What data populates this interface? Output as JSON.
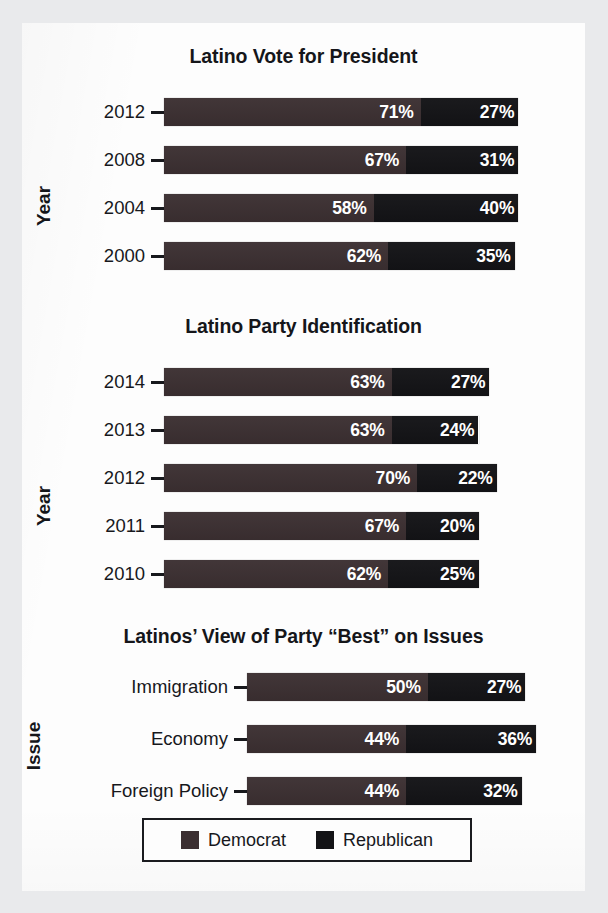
{
  "page": {
    "background_color": "#e9eaec",
    "sheet_color": "#fdfdfd"
  },
  "colors": {
    "democrat": "#3b2f31",
    "republican": "#131316",
    "text": "#17181c"
  },
  "legend": {
    "items": [
      {
        "label": "Democrat",
        "color": "#3b2f31",
        "swatch": "democrat-swatch"
      },
      {
        "label": "Republican",
        "color": "#131316",
        "swatch": "republican-swatch"
      }
    ]
  },
  "chart_data": [
    {
      "id": "latino-vote-for-president",
      "type": "bar",
      "orientation": "horizontal",
      "stacked": true,
      "title": "Latino Vote for President",
      "ylabel": "Year",
      "xlabel": "",
      "grid": false,
      "legend_position": "bottom",
      "xlim": [
        0,
        100
      ],
      "categories": [
        "2012",
        "2008",
        "2004",
        "2000"
      ],
      "series": [
        {
          "name": "Democrat",
          "values": [
            71,
            67,
            58,
            62
          ]
        },
        {
          "name": "Republican",
          "values": [
            27,
            31,
            40,
            35
          ]
        }
      ],
      "labels": {
        "Democrat": [
          "71%",
          "67%",
          "58%",
          "62%"
        ],
        "Republican": [
          "27%",
          "31%",
          "40%",
          "35%"
        ]
      }
    },
    {
      "id": "latino-party-identification",
      "type": "bar",
      "orientation": "horizontal",
      "stacked": true,
      "title": "Latino Party Identification",
      "ylabel": "Year",
      "xlabel": "",
      "grid": false,
      "legend_position": "bottom",
      "xlim": [
        0,
        100
      ],
      "categories": [
        "2014",
        "2013",
        "2012",
        "2011",
        "2010"
      ],
      "series": [
        {
          "name": "Democrat",
          "values": [
            63,
            63,
            70,
            67,
            62
          ]
        },
        {
          "name": "Republican",
          "values": [
            27,
            24,
            22,
            20,
            25
          ]
        }
      ],
      "labels": {
        "Democrat": [
          "63%",
          "63%",
          "70%",
          "67%",
          "62%"
        ],
        "Republican": [
          "27%",
          "24%",
          "22%",
          "20%",
          "25%"
        ]
      }
    },
    {
      "id": "latinos-view-of-party-best-on-issues",
      "type": "bar",
      "orientation": "horizontal",
      "stacked": true,
      "title": "Latinos’ View of Party “Best” on Issues",
      "ylabel": "Issue",
      "xlabel": "",
      "grid": false,
      "legend_position": "bottom",
      "xlim": [
        0,
        100
      ],
      "categories": [
        "Immigration",
        "Economy",
        "Foreign Policy"
      ],
      "series": [
        {
          "name": "Democrat",
          "values": [
            50,
            44,
            44
          ]
        },
        {
          "name": "Republican",
          "values": [
            27,
            36,
            32
          ]
        }
      ],
      "labels": {
        "Democrat": [
          "50%",
          "44%",
          "44%"
        ],
        "Republican": [
          "27%",
          "36%",
          "32%"
        ]
      }
    }
  ]
}
